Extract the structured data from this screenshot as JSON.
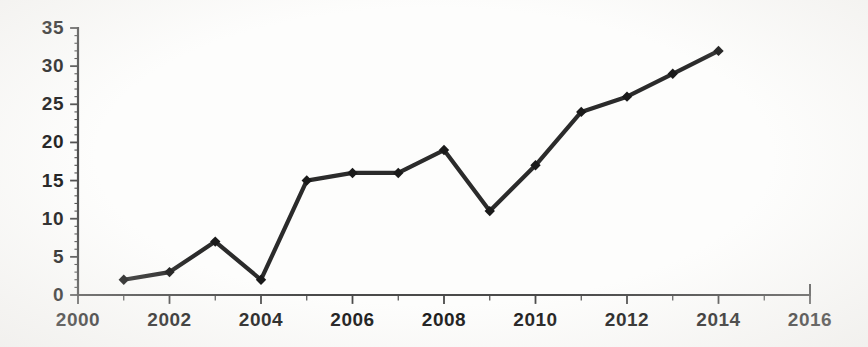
{
  "chart_data": {
    "type": "line",
    "title": "",
    "subtitle": "",
    "xlabel": "",
    "ylabel": "",
    "x": [
      2001,
      2002,
      2003,
      2004,
      2005,
      2006,
      2007,
      2008,
      2009,
      2010,
      2011,
      2012,
      2013,
      2014
    ],
    "values": [
      2,
      3,
      7,
      2,
      15,
      16,
      16,
      19,
      11,
      17,
      24,
      26,
      29,
      32
    ],
    "series": [
      {
        "name": "",
        "x": [
          2001,
          2002,
          2003,
          2004,
          2005,
          2006,
          2007,
          2008,
          2009,
          2010,
          2011,
          2012,
          2013,
          2014
        ],
        "values": [
          2,
          3,
          7,
          2,
          15,
          16,
          16,
          19,
          11,
          17,
          24,
          26,
          29,
          32
        ]
      }
    ],
    "xlim": [
      2000,
      2016
    ],
    "ylim": [
      0,
      35
    ],
    "xticks": [
      2000,
      2002,
      2004,
      2006,
      2008,
      2010,
      2012,
      2014,
      2016
    ],
    "xtick_labels": [
      "2000",
      "2002",
      "2004",
      "2006",
      "2008",
      "2010",
      "2012",
      "2014",
      "2016"
    ],
    "yticks": [
      0,
      5,
      10,
      15,
      20,
      25,
      30,
      35
    ],
    "ytick_labels": [
      "0",
      "5",
      "10",
      "15",
      "20",
      "25",
      "30",
      "35"
    ],
    "minor_ytick_step": 1,
    "grid": false,
    "legend": false,
    "legend_position": "none",
    "marker": "diamond",
    "line_color": "#2b2b2b",
    "marker_color": "#1a1a1a",
    "axis_color": "#4a4a4a",
    "background_color": "#fdfdfc"
  }
}
